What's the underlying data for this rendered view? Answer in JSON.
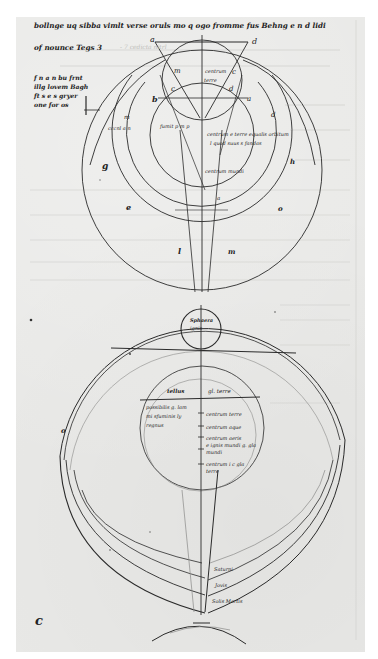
{
  "document": {
    "type": "medieval manuscript folio",
    "colors": {
      "page": "#e9e9e7",
      "margin": "#ffffff",
      "ink": "#2a2a2a",
      "bleed_through": "#c9c9c6"
    }
  },
  "header_text": {
    "line1": "bollnge uq sibba vimlt verse oruls mo q ogo fromme fus Behng e n d lidi",
    "line2": "of nounce Tegs 3"
  },
  "margin_note": {
    "lines": [
      "f n a n bu frnt",
      "illg lovem Bagh",
      "ft s e s gryer",
      "one for os"
    ]
  },
  "upper_diagram": {
    "letters": {
      "a_top_left": "a",
      "d_top_right": "d",
      "m": "m",
      "c": "c",
      "d_inner": "d",
      "a_right": "a",
      "b": "b",
      "m_left": "m",
      "d_right": "d",
      "g": "g",
      "e": "e",
      "l": "l",
      "h": "h",
      "o": "o",
      "m_lower": "m",
      "c_right": "c"
    },
    "labels": {
      "center_top": "centrum",
      "center_sub": "terre",
      "right_line1": "centrum e terre equalis orbitum",
      "right_line2": "l quod suus s fandas",
      "lower_center": "centrum mundi",
      "left_mid": "cccnl a n",
      "left_small": "fumit p m p"
    }
  },
  "lower_diagram": {
    "small_circle_label1": "Sphaera",
    "small_circle_label2": "ignis",
    "inner_left_header": "tellus",
    "inner_right_header": "gl. terre",
    "inner_left_lines": [
      "possibilis g. lam",
      "mi sfuminis ly",
      "regnus"
    ],
    "inner_right_lines": [
      "centrum terre",
      "centrum aque",
      "centrum aeris",
      "e ignis mundi g. gla",
      "mundi",
      "centrum i c gla",
      "terre"
    ],
    "left_mark": "o",
    "band_labels": [
      "Saturni",
      "Jovis",
      "Solis Martis"
    ],
    "corner_mark": "c"
  }
}
